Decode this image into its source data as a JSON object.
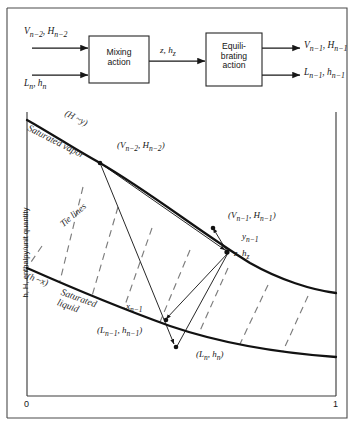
{
  "figure": {
    "type": "enthalpy-concentration-diagram",
    "title": "",
    "frame": {
      "stroke": "#3a3a3a"
    }
  },
  "flowsheet": {
    "inputs": [
      {
        "id": "in-vapor",
        "label_html": "V<sub>n&minus;2</sub>, H<sub>n&minus;2</sub>",
        "label_text": "V n-2 , H n-2"
      },
      {
        "id": "in-liquid",
        "label_html": "L<sub>n</sub>, h<sub>n</sub>",
        "label_text": "L n , h n"
      }
    ],
    "boxes": [
      {
        "id": "mixing",
        "line1": "Mixing",
        "line2": "action"
      },
      {
        "id": "equilibrating",
        "line1": "Equili-",
        "line2": "brating",
        "line3": "action"
      }
    ],
    "intermediate": {
      "id": "stream-z",
      "label_html": "z, h<sub>z</sub>",
      "label_text": "z, h z"
    },
    "outputs": [
      {
        "id": "out-vapor",
        "label_html": "V<sub>n&minus;1</sub>, H<sub>n&minus;1</sub>",
        "label_text": "V n-1 , H n-1"
      },
      {
        "id": "out-liquid",
        "label_html": "L<sub>n&minus;1</sub>, h<sub>n&minus;1</sub>",
        "label_text": "L n-1 , h n-1"
      }
    ]
  },
  "plot": {
    "ylabel": "h, H, enthalpy/unit quantity",
    "xticks": [
      "0",
      "1"
    ],
    "xlabel": "",
    "curves": [
      {
        "id": "saturated-vapor",
        "name_html": "Saturated vapor",
        "relation_html": "(H &#126;y)",
        "relation_text": "(H ~y)"
      },
      {
        "id": "saturated-liquid",
        "name_html": "Saturated liquid",
        "relation_html": "(h &#126;x)",
        "relation_text": "(h ~x)"
      }
    ],
    "tie_lines_label": "Tie lines",
    "point_labels": [
      {
        "id": "pt-v-n-2",
        "html": "(V<sub>n&minus;2</sub>, H<sub>n&minus;2</sub>)",
        "text": "(V n-2 , H n-2 )"
      },
      {
        "id": "pt-v-n-1",
        "html": "(V<sub>n&minus;1</sub>, H<sub>n&minus;1</sub>)",
        "text": "(V n-1 , H n-1 )"
      },
      {
        "id": "pt-l-n-1",
        "html": "(L<sub>n&minus;1</sub>, h<sub>n&minus;1</sub>)",
        "text": "(L n-1 , h n-1 )"
      },
      {
        "id": "pt-l-n",
        "html": "(L<sub>n</sub>, h<sub>n</sub>)",
        "text": "(L n , h n )"
      },
      {
        "id": "pt-z",
        "html": "z, h<sub>z</sub>",
        "text": "z, h z"
      },
      {
        "id": "pt-y-n-1",
        "html": "y<sub>n&minus;1</sub>",
        "text": "y n-1"
      },
      {
        "id": "pt-x-n-1",
        "html": "x<sub>n&minus;1</sub>",
        "text": "x n-1"
      }
    ]
  },
  "chart_data": {
    "type": "line",
    "title": "",
    "xlabel": "",
    "ylabel": "h, H, enthalpy/unit quantity",
    "xlim": [
      0,
      1
    ],
    "ylim": [
      0,
      1
    ],
    "xtick_labels": [
      "0",
      "1"
    ],
    "ytick_labels": [],
    "grid": false,
    "legend": "none",
    "series": [
      {
        "name": "Saturated vapor",
        "annotation": "(H ~y)",
        "style": "solid-thick",
        "points_px": [
          [
            27,
            120
          ],
          [
            60,
            140
          ],
          [
            100,
            163
          ],
          [
            140,
            190
          ],
          [
            180,
            218
          ],
          [
            220,
            245
          ],
          [
            260,
            268
          ],
          [
            300,
            283
          ],
          [
            330,
            291
          ]
        ]
      },
      {
        "name": "Saturated liquid",
        "annotation": "(h ~x)",
        "style": "solid-thick",
        "points_px": [
          [
            27,
            268
          ],
          [
            70,
            287
          ],
          [
            120,
            307
          ],
          [
            170,
            326
          ],
          [
            210,
            338
          ],
          [
            250,
            347
          ],
          [
            290,
            353
          ],
          [
            330,
            356
          ]
        ]
      }
    ],
    "tie_lines": {
      "label": "Tie lines",
      "style": "dashed",
      "segments_px": [
        [
          [
            42,
            246
          ],
          [
            27,
            268
          ]
        ],
        [
          [
            83,
            187
          ],
          [
            60,
            281
          ]
        ],
        [
          [
            118,
            207
          ],
          [
            92,
            296
          ]
        ],
        [
          [
            152,
            228
          ],
          [
            124,
            308
          ]
        ],
        [
          [
            190,
            250
          ],
          [
            160,
            322
          ]
        ],
        [
          [
            228,
            268
          ],
          [
            199,
            333
          ]
        ],
        [
          [
            268,
            285
          ],
          [
            240,
            344
          ]
        ],
        [
          [
            308,
            296
          ],
          [
            283,
            351
          ]
        ]
      ]
    },
    "construction_lines": {
      "style": "thin-solid-with-arrow",
      "segments_px": [
        {
          "from_px": [
            100,
            163
          ],
          "to_px": [
            176,
            348
          ],
          "arrow": "end",
          "name": "vapor-to-L_n"
        },
        {
          "from_px": [
            100,
            163
          ],
          "to_px": [
            228,
            253
          ],
          "arrow": "end",
          "name": "vapor-to-z"
        },
        {
          "from_px": [
            228,
            253
          ],
          "to_px": [
            163,
            322
          ],
          "arrow": "end",
          "name": "z-to-x_n-1"
        },
        {
          "from_px": [
            228,
            253
          ],
          "to_px": [
            212,
            226
          ],
          "arrow": "end",
          "name": "z-to-y_n-1"
        },
        {
          "from_px": [
            176,
            348
          ],
          "to_px": [
            228,
            253
          ],
          "arrow": "none",
          "name": "L_n-to-z"
        }
      ]
    },
    "marked_points_px": [
      {
        "name": "(V n-2 , H n-2 )",
        "px": [
          100,
          163
        ]
      },
      {
        "name": "(V n-1 , H n-1 )",
        "px": [
          212,
          226
        ]
      },
      {
        "name": "(L n-1 , h n-1 )",
        "px": [
          163,
          322
        ]
      },
      {
        "name": "(L n , h n )",
        "px": [
          176,
          348
        ]
      },
      {
        "name": "z, h z",
        "px": [
          228,
          253
        ]
      }
    ]
  }
}
